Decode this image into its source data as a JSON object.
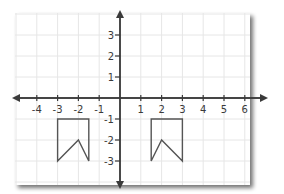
{
  "diagram": {
    "type": "coordinate-grid",
    "x_axis": {
      "ticks": [
        -4,
        -3,
        -2,
        -1,
        1,
        2,
        3,
        4,
        5,
        6
      ],
      "labels": [
        "-4",
        "-3",
        "-2",
        "-1",
        "1",
        "2",
        "3",
        "4",
        "5",
        "6"
      ]
    },
    "y_axis": {
      "ticks": [
        3,
        2,
        1,
        -1,
        -2,
        -3
      ],
      "labels": [
        "3",
        "2",
        "1",
        "-1",
        "-2",
        "-3"
      ]
    },
    "shapes": [
      {
        "name": "left-flag",
        "points": [
          [
            -3,
            -1
          ],
          [
            -1.5,
            -1
          ],
          [
            -1.5,
            -3
          ],
          [
            -2,
            -2
          ],
          [
            -3,
            -3
          ]
        ]
      },
      {
        "name": "right-flag",
        "points": [
          [
            1.5,
            -1
          ],
          [
            3,
            -1
          ],
          [
            3,
            -3
          ],
          [
            2,
            -2
          ],
          [
            1.5,
            -3
          ]
        ]
      }
    ],
    "colors": {
      "grid": "#e6e6e6",
      "axis": "#3a3a3a",
      "shape": "#555555",
      "panel": "#ffffff",
      "shadow": "#9a9a9a"
    }
  }
}
